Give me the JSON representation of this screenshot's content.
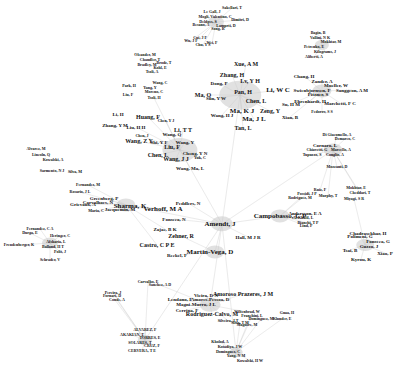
{
  "graph": {
    "type": "co-authorship network",
    "edge_color": "#bbbbbb",
    "node_color": "#9a9a9a",
    "label_color": "#111111",
    "nodes": [
      {
        "label": "Sakellari, T",
        "x": 232,
        "y": 8,
        "s": 2
      },
      {
        "label": "Le Gall, J",
        "x": 212,
        "y": 12,
        "s": 2
      },
      {
        "label": "Mogli, Valentino, C",
        "x": 215,
        "y": 17,
        "s": 2
      },
      {
        "label": "Dimitri, D",
        "x": 240,
        "y": 20,
        "s": 2
      },
      {
        "label": "Deldoss, S",
        "x": 208,
        "y": 22,
        "s": 2
      },
      {
        "label": "Besano, A",
        "x": 201,
        "y": 25,
        "s": 2
      },
      {
        "label": "Lamprti, D",
        "x": 226,
        "y": 26,
        "s": 2
      },
      {
        "label": "Song, R",
        "x": 218,
        "y": 29,
        "s": 2
      },
      {
        "label": "Cui, J F",
        "x": 200,
        "y": 38,
        "s": 2
      },
      {
        "label": "Wu, J F",
        "x": 191,
        "y": 41,
        "s": 2
      },
      {
        "label": "Wei, F",
        "x": 212,
        "y": 43,
        "s": 2
      },
      {
        "label": "Chu, Y S",
        "x": 203,
        "y": 45,
        "s": 2
      },
      {
        "label": "Xue, A M",
        "x": 246,
        "y": 64,
        "s": 4
      },
      {
        "label": "Zhang, H",
        "x": 232,
        "y": 75,
        "s": 4
      },
      {
        "label": "Dong, P",
        "x": 219,
        "y": 83,
        "s": 3
      },
      {
        "label": "Lv, Y H",
        "x": 250,
        "y": 81,
        "s": 4
      },
      {
        "label": "Pan, H",
        "x": 243,
        "y": 92,
        "s": 4
      },
      {
        "label": "Li, W C",
        "x": 278,
        "y": 90,
        "s": 5
      },
      {
        "label": "Ma, Q",
        "x": 203,
        "y": 95,
        "s": 4
      },
      {
        "label": "Sun, Y W",
        "x": 216,
        "y": 98,
        "s": 3
      },
      {
        "label": "Chen, L",
        "x": 256,
        "y": 101,
        "s": 4
      },
      {
        "label": "Su, H M",
        "x": 291,
        "y": 104,
        "s": 3
      },
      {
        "label": "Ma, K J",
        "x": 242,
        "y": 111,
        "s": 5
      },
      {
        "label": "Wang, H J",
        "x": 222,
        "y": 115,
        "s": 3
      },
      {
        "label": "Zeng, Y",
        "x": 270,
        "y": 111,
        "s": 4
      },
      {
        "label": "Ma, J L",
        "x": 254,
        "y": 119,
        "s": 5
      },
      {
        "label": "Xian, B",
        "x": 290,
        "y": 117,
        "s": 3
      },
      {
        "label": "Tan, L",
        "x": 243,
        "y": 128,
        "s": 4
      },
      {
        "label": "Bagin, B",
        "x": 318,
        "y": 33,
        "s": 2
      },
      {
        "label": "Vallini, N K",
        "x": 320,
        "y": 38,
        "s": 2
      },
      {
        "label": "Mokhtar, M",
        "x": 331,
        "y": 42,
        "s": 2
      },
      {
        "label": "Petrenko, E",
        "x": 314,
        "y": 47,
        "s": 2
      },
      {
        "label": "Kilograms, J",
        "x": 325,
        "y": 52,
        "s": 2
      },
      {
        "label": "Aliberti, A",
        "x": 314,
        "y": 57,
        "s": 2
      },
      {
        "label": "Chang, H",
        "x": 304,
        "y": 76,
        "s": 3
      },
      {
        "label": "Zander, A",
        "x": 322,
        "y": 81,
        "s": 3
      },
      {
        "label": "Mueller, W",
        "x": 336,
        "y": 85,
        "s": 3
      },
      {
        "label": "Swienbjornsen, F",
        "x": 312,
        "y": 90,
        "s": 3
      },
      {
        "label": "Sanggeon, A M",
        "x": 352,
        "y": 90,
        "s": 3
      },
      {
        "label": "Pitzner, S",
        "x": 318,
        "y": 94,
        "s": 3
      },
      {
        "label": "Ehrenhardt, H",
        "x": 310,
        "y": 101,
        "s": 3
      },
      {
        "label": "Marchetti, F C",
        "x": 340,
        "y": 103,
        "s": 3
      },
      {
        "label": "Fedorov, S S",
        "x": 322,
        "y": 112,
        "s": 2
      },
      {
        "label": "Oleander, M",
        "x": 145,
        "y": 55,
        "s": 2
      },
      {
        "label": "Chandler, T",
        "x": 150,
        "y": 60,
        "s": 2
      },
      {
        "label": "Bradley, M",
        "x": 147,
        "y": 65,
        "s": 2
      },
      {
        "label": "Brodz, T",
        "x": 164,
        "y": 63,
        "s": 2
      },
      {
        "label": "Kohl, E",
        "x": 160,
        "y": 68,
        "s": 2
      },
      {
        "label": "Tsoli, A",
        "x": 152,
        "y": 72,
        "s": 2
      },
      {
        "label": "Wang, C",
        "x": 160,
        "y": 83,
        "s": 2
      },
      {
        "label": "Park, H",
        "x": 129,
        "y": 86,
        "s": 2
      },
      {
        "label": "Yang, Y",
        "x": 150,
        "y": 88,
        "s": 2
      },
      {
        "label": "Moreno, C",
        "x": 154,
        "y": 92,
        "s": 2
      },
      {
        "label": "Liu, F",
        "x": 128,
        "y": 95,
        "s": 2
      },
      {
        "label": "Tsoli, H",
        "x": 154,
        "y": 98,
        "s": 2
      },
      {
        "label": "Li, H",
        "x": 118,
        "y": 114,
        "s": 3
      },
      {
        "label": "Huang, F",
        "x": 148,
        "y": 117,
        "s": 4
      },
      {
        "label": "Chen, Y J",
        "x": 166,
        "y": 121,
        "s": 2
      },
      {
        "label": "Zhang, Y M",
        "x": 115,
        "y": 125,
        "s": 3
      },
      {
        "label": "Liu, H H",
        "x": 136,
        "y": 127,
        "s": 3
      },
      {
        "label": "Li, T T",
        "x": 183,
        "y": 130,
        "s": 4
      },
      {
        "label": "Chen, J",
        "x": 142,
        "y": 136,
        "s": 2
      },
      {
        "label": "Wang, Q",
        "x": 172,
        "y": 134,
        "s": 3
      },
      {
        "label": "Wang, Z Y",
        "x": 139,
        "y": 141,
        "s": 4
      },
      {
        "label": "Shi, Y F",
        "x": 159,
        "y": 142,
        "s": 3
      },
      {
        "label": "Wang, Y",
        "x": 185,
        "y": 142,
        "s": 3
      },
      {
        "label": "Liu, F",
        "x": 172,
        "y": 147,
        "s": 4
      },
      {
        "label": "Chen, L",
        "x": 158,
        "y": 155,
        "s": 4
      },
      {
        "label": "Cheng, Y N",
        "x": 195,
        "y": 153,
        "s": 3
      },
      {
        "label": "Wang, J J",
        "x": 176,
        "y": 159,
        "s": 4
      },
      {
        "label": "Wang, Ma, L",
        "x": 190,
        "y": 168,
        "s": 3
      },
      {
        "label": "Yuk, C",
        "x": 200,
        "y": 158,
        "s": 2
      },
      {
        "label": "Di Giacomello, A",
        "x": 337,
        "y": 135,
        "s": 2
      },
      {
        "label": "Demarco, C",
        "x": 345,
        "y": 139,
        "s": 2
      },
      {
        "label": "Cornaro, L",
        "x": 325,
        "y": 145,
        "s": 3
      },
      {
        "label": "Chiavetti, G",
        "x": 317,
        "y": 150,
        "s": 2
      },
      {
        "label": "Marcello, A",
        "x": 341,
        "y": 150,
        "s": 2
      },
      {
        "label": "Tupuzzo, S",
        "x": 312,
        "y": 155,
        "s": 2
      },
      {
        "label": "Conglio, A",
        "x": 335,
        "y": 155,
        "s": 2
      },
      {
        "label": "Mozzanti, D",
        "x": 337,
        "y": 167,
        "s": 2
      },
      {
        "label": "Mokhtar, E",
        "x": 356,
        "y": 188,
        "s": 2
      },
      {
        "label": "Cheddari, T",
        "x": 360,
        "y": 193,
        "s": 2
      },
      {
        "label": "Ruiz, F",
        "x": 320,
        "y": 190,
        "s": 2
      },
      {
        "label": "Possidi, J P",
        "x": 307,
        "y": 194,
        "s": 2
      },
      {
        "label": "Murphy, T",
        "x": 328,
        "y": 196,
        "s": 2
      },
      {
        "label": "Rodriguez, M",
        "x": 300,
        "y": 198,
        "s": 2
      },
      {
        "label": "Miyagi, S R",
        "x": 354,
        "y": 199,
        "s": 2
      },
      {
        "label": "Andersson, E A",
        "x": 305,
        "y": 213,
        "s": 3
      },
      {
        "label": "Al-Khalil, L",
        "x": 303,
        "y": 218,
        "s": 2
      },
      {
        "label": "Bianchi, T P",
        "x": 308,
        "y": 223,
        "s": 2
      },
      {
        "label": "Lind, P",
        "x": 306,
        "y": 226,
        "s": 2
      },
      {
        "label": "Fernandez, C A",
        "x": 40,
        "y": 229,
        "s": 2
      },
      {
        "label": "Durga, E",
        "x": 30,
        "y": 233,
        "s": 2
      },
      {
        "label": "Heringer, C",
        "x": 60,
        "y": 236,
        "s": 2
      },
      {
        "label": "Afsharia, L",
        "x": 56,
        "y": 242,
        "s": 2
      },
      {
        "label": "Freudenberger, K",
        "x": 19,
        "y": 245,
        "s": 2
      },
      {
        "label": "Balland, H T",
        "x": 53,
        "y": 247,
        "s": 2
      },
      {
        "label": "Polit, J",
        "x": 60,
        "y": 252,
        "s": 2
      },
      {
        "label": "Schrader, V",
        "x": 50,
        "y": 260,
        "s": 2
      },
      {
        "label": "Verhoff, M A",
        "x": 163,
        "y": 209,
        "s": 5
      },
      {
        "label": "Peddlers, N",
        "x": 188,
        "y": 203,
        "s": 3
      },
      {
        "label": "Fonseca, N",
        "x": 174,
        "y": 219,
        "s": 3
      },
      {
        "label": "Amendt, J",
        "x": 220,
        "y": 224,
        "s": 5
      },
      {
        "label": "Zajac, B K",
        "x": 165,
        "y": 229,
        "s": 3
      },
      {
        "label": "Zehner, R",
        "x": 181,
        "y": 236,
        "s": 4
      },
      {
        "label": "Campobasso, C P",
        "x": 280,
        "y": 216,
        "s": 5
      },
      {
        "label": "Castro, C P E",
        "x": 157,
        "y": 245,
        "s": 4
      },
      {
        "label": "Martin-Vega, D",
        "x": 210,
        "y": 252,
        "s": 5
      },
      {
        "label": "Hall, M J R",
        "x": 248,
        "y": 237,
        "s": 3
      },
      {
        "label": "Reckel, F",
        "x": 177,
        "y": 255,
        "s": 3
      },
      {
        "label": "Vieira, D N",
        "x": 206,
        "y": 295,
        "s": 3
      },
      {
        "label": "Amores-Pessoa, D",
        "x": 210,
        "y": 299,
        "s": 3
      },
      {
        "label": "Amoroso Prazeres, J M",
        "x": 243,
        "y": 294,
        "s": 4
      },
      {
        "label": "Lendano, F",
        "x": 180,
        "y": 299,
        "s": 3
      },
      {
        "label": "Magni-Murro, J L",
        "x": 196,
        "y": 304,
        "s": 3
      },
      {
        "label": "Cerrina, F",
        "x": 187,
        "y": 310,
        "s": 3
      },
      {
        "label": "Rodriguez-Calvo, M",
        "x": 212,
        "y": 314,
        "s": 4
      },
      {
        "label": "Wiltenbrad, W",
        "x": 247,
        "y": 312,
        "s": 2
      },
      {
        "label": "Franchini, L",
        "x": 252,
        "y": 316,
        "s": 2
      },
      {
        "label": "Dominguez, M",
        "x": 261,
        "y": 319,
        "s": 2
      },
      {
        "label": "Silveira, J T",
        "x": 228,
        "y": 321,
        "s": 2
      },
      {
        "label": "Silva, T M",
        "x": 240,
        "y": 323,
        "s": 2
      },
      {
        "label": "Maguire, M",
        "x": 247,
        "y": 325,
        "s": 2
      },
      {
        "label": "Klunder, E",
        "x": 282,
        "y": 319,
        "s": 2
      },
      {
        "label": "Gnaa, H",
        "x": 287,
        "y": 313,
        "s": 2
      },
      {
        "label": "Chadrasekhar, H",
        "x": 368,
        "y": 233,
        "s": 3
      },
      {
        "label": "Polimeni, G",
        "x": 360,
        "y": 236,
        "s": 3
      },
      {
        "label": "Fonseca, G",
        "x": 378,
        "y": 241,
        "s": 3
      },
      {
        "label": "Guzzo, J",
        "x": 369,
        "y": 246,
        "s": 3
      },
      {
        "label": "Tsai, B",
        "x": 350,
        "y": 250,
        "s": 3
      },
      {
        "label": "Xiao, P",
        "x": 385,
        "y": 253,
        "s": 3
      },
      {
        "label": "Kyrou, K",
        "x": 361,
        "y": 259,
        "s": 3
      },
      {
        "label": "Kholod, A",
        "x": 220,
        "y": 342,
        "s": 2
      },
      {
        "label": "Kotadiya, J W",
        "x": 230,
        "y": 347,
        "s": 2
      },
      {
        "label": "Dominguez, C",
        "x": 228,
        "y": 352,
        "s": 2
      },
      {
        "label": "Yang, N M",
        "x": 236,
        "y": 356,
        "s": 2
      },
      {
        "label": "Kowalski, H W",
        "x": 250,
        "y": 361,
        "s": 2
      },
      {
        "label": "ALVAREZ, F",
        "x": 145,
        "y": 330,
        "s": 2
      },
      {
        "label": "AKAKIAN, T",
        "x": 132,
        "y": 335,
        "s": 2
      },
      {
        "label": "TORRES, E",
        "x": 150,
        "y": 338,
        "s": 2
      },
      {
        "label": "SOLARES, T",
        "x": 140,
        "y": 343,
        "s": 2
      },
      {
        "label": "CRUZ, F",
        "x": 152,
        "y": 346,
        "s": 2
      },
      {
        "label": "CERVERA, T E",
        "x": 142,
        "y": 351,
        "s": 2
      },
      {
        "label": "Pereira, J",
        "x": 113,
        "y": 293,
        "s": 2
      },
      {
        "label": "Carvalho, E",
        "x": 148,
        "y": 282,
        "s": 2
      },
      {
        "label": "Sanchez, A D",
        "x": 160,
        "y": 285,
        "s": 2
      },
      {
        "label": "Conde, A",
        "x": 117,
        "y": 300,
        "s": 2
      },
      {
        "label": "Fornari, D",
        "x": 112,
        "y": 296,
        "s": 2
      },
      {
        "label": "Alvarez, M",
        "x": 36,
        "y": 149,
        "s": 2
      },
      {
        "label": "Lincoln, Q",
        "x": 41,
        "y": 155,
        "s": 2
      },
      {
        "label": "Kowalski, A",
        "x": 53,
        "y": 160,
        "s": 2
      },
      {
        "label": "Sarmento, N J",
        "x": 52,
        "y": 171,
        "s": 2
      },
      {
        "label": "Silva, M",
        "x": 75,
        "y": 172,
        "s": 2
      },
      {
        "label": "Fernandez, M",
        "x": 88,
        "y": 185,
        "s": 2
      },
      {
        "label": "Rosario, J L",
        "x": 80,
        "y": 192,
        "s": 2
      },
      {
        "label": "Greenberg, P",
        "x": 104,
        "y": 198,
        "s": 3
      },
      {
        "label": "Carvalhaes, N",
        "x": 98,
        "y": 202,
        "s": 3
      },
      {
        "label": "Grievaux, A",
        "x": 83,
        "y": 204,
        "s": 3
      },
      {
        "label": "Sharma, K",
        "x": 130,
        "y": 206,
        "s": 5
      },
      {
        "label": "Jacquemin, M",
        "x": 120,
        "y": 209,
        "s": 3
      },
      {
        "label": "Maria, C",
        "x": 96,
        "y": 211,
        "s": 2
      }
    ],
    "hubs": [
      {
        "x": 240,
        "y": 95,
        "r": 26
      },
      {
        "x": 180,
        "y": 150,
        "r": 22
      },
      {
        "x": 222,
        "y": 224,
        "r": 14
      },
      {
        "x": 280,
        "y": 216,
        "r": 12
      },
      {
        "x": 215,
        "y": 252,
        "r": 12
      },
      {
        "x": 126,
        "y": 205,
        "r": 12
      },
      {
        "x": 322,
        "y": 91,
        "r": 12
      },
      {
        "x": 333,
        "y": 150,
        "r": 12
      },
      {
        "x": 365,
        "y": 245,
        "r": 11
      },
      {
        "x": 210,
        "y": 305,
        "r": 13
      },
      {
        "x": 216,
        "y": 22,
        "r": 10
      },
      {
        "x": 322,
        "y": 45,
        "r": 9
      },
      {
        "x": 50,
        "y": 243,
        "r": 10
      },
      {
        "x": 145,
        "y": 340,
        "r": 9
      },
      {
        "x": 236,
        "y": 352,
        "r": 8
      }
    ]
  }
}
